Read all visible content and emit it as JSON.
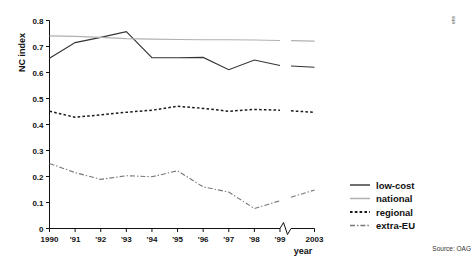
{
  "chart_data": {
    "type": "line",
    "title": "",
    "xlabel": "year",
    "ylabel": "NC index",
    "xlim": [
      1990,
      2003
    ],
    "ylim": [
      0,
      0.8
    ],
    "grid": false,
    "legend_position": "right",
    "axis_break": {
      "between": [
        "'99",
        "2003"
      ],
      "label": "zigzag-break"
    },
    "x": [
      1990,
      1991,
      1992,
      1993,
      1994,
      1995,
      1996,
      1997,
      1998,
      1999,
      2003
    ],
    "xtick_labels": [
      "1990",
      "'91",
      "'92",
      "'93",
      "'94",
      "'95",
      "'96",
      "'97",
      "'98",
      "'99",
      "2003"
    ],
    "ytick_labels": [
      "0",
      "0.1",
      "0.2",
      "0.3",
      "0.4",
      "0.5",
      "0.6",
      "0.7",
      "0.8"
    ],
    "ytick_values": [
      0,
      0.1,
      0.2,
      0.3,
      0.4,
      0.5,
      0.6,
      0.7,
      0.8
    ],
    "series": [
      {
        "name": "low-cost",
        "style": "solid",
        "color": "#333333",
        "width": 1.1,
        "values": [
          0.655,
          0.715,
          0.735,
          0.757,
          0.657,
          0.657,
          0.658,
          0.611,
          0.648,
          0.627,
          0.62
        ]
      },
      {
        "name": "national",
        "style": "solid",
        "color": "#b0b0b0",
        "width": 1.2,
        "values": [
          0.741,
          0.739,
          0.735,
          0.73,
          0.728,
          0.727,
          0.726,
          0.726,
          0.725,
          0.723,
          0.721
        ]
      },
      {
        "name": "regional",
        "style": "dashed",
        "color": "#1a1a1a",
        "width": 1.5,
        "values": [
          0.451,
          0.428,
          0.437,
          0.447,
          0.455,
          0.47,
          0.462,
          0.451,
          0.458,
          0.455,
          0.447
        ]
      },
      {
        "name": "extra-EU",
        "style": "dashdot",
        "color": "#777777",
        "width": 1.1,
        "values": [
          0.25,
          0.215,
          0.189,
          0.203,
          0.199,
          0.222,
          0.16,
          0.14,
          0.077,
          0.107,
          0.148
        ]
      }
    ]
  },
  "legend": {
    "items": [
      {
        "label": "low-cost"
      },
      {
        "label": "national"
      },
      {
        "label": "regional"
      },
      {
        "label": "extra-EU"
      }
    ]
  },
  "footer": {
    "source": "Source: OAG"
  },
  "corner": {
    "mark": "ens"
  }
}
